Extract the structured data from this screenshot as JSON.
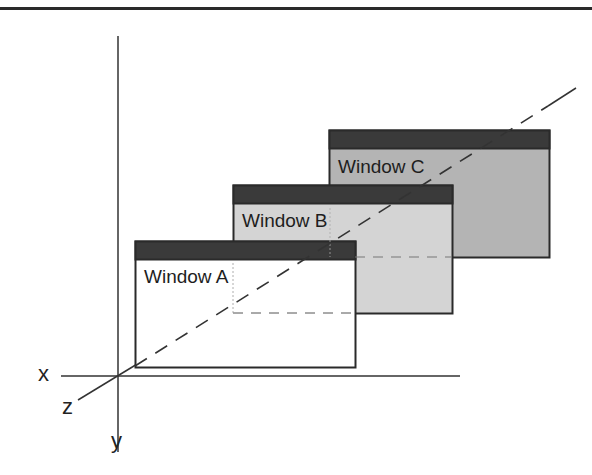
{
  "diagram": {
    "axes": {
      "x_label": "x",
      "y_label": "y",
      "z_label": "z"
    },
    "windows": [
      {
        "name": "Window C",
        "prefix": "Window",
        "letter": "C",
        "fill": "#b4b4b4",
        "titlebar": "#3a3a3a"
      },
      {
        "name": "Window B",
        "prefix": "Window",
        "letter": "B",
        "fill": "#d4d4d4",
        "titlebar": "#3a3a3a"
      },
      {
        "name": "Window A",
        "prefix": "Window",
        "letter": "A",
        "fill": "#ffffff",
        "titlebar": "#3a3a3a"
      }
    ],
    "colors": {
      "line": "#333333",
      "border": "#2a2a2a"
    }
  }
}
